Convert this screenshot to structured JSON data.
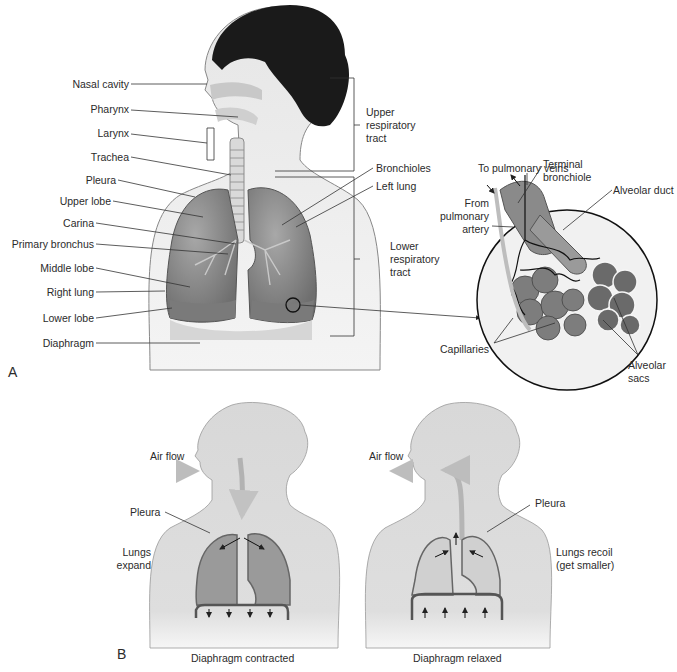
{
  "panel_a": {
    "panel_letter": "A",
    "left_labels": [
      "Nasal cavity",
      "Pharynx",
      "Larynx",
      "Trachea",
      "Pleura",
      "Upper lobe",
      "Carina",
      "Primary bronchus",
      "Middle lobe",
      "Right lung",
      "Lower lobe",
      "Diaphragm"
    ],
    "upper_tract": [
      "Upper",
      "respiratory",
      "tract"
    ],
    "lower_tract": [
      "Lower",
      "respiratory",
      "tract"
    ],
    "bronchioles": "Bronchioles",
    "left_lung": "Left lung",
    "inset": {
      "to_pulmonary_veins": "To pulmonary veins",
      "from_pulmonary_artery": [
        "From",
        "pulmonary",
        "artery"
      ],
      "terminal_bronchiole": [
        "Terminal",
        "bronchiole"
      ],
      "alveolar_duct": "Alveolar duct",
      "capillaries": "Capillaries",
      "alveolar_sacs": [
        "Alveolar",
        "sacs"
      ]
    }
  },
  "panel_b": {
    "panel_letter": "B",
    "inhale": {
      "air_flow": "Air flow",
      "pleura": "Pleura",
      "lungs_state": [
        "Lungs",
        "expand"
      ],
      "caption": "Diaphragm contracted"
    },
    "exhale": {
      "air_flow": "Air flow",
      "pleura": "Pleura",
      "lungs_state": [
        "Lungs recoil",
        "(get smaller)"
      ],
      "caption": "Diaphragm relaxed"
    }
  },
  "colors": {
    "skin": "#dcdcdc",
    "hair": "#1a1a1a",
    "lung": "#8f8f8f",
    "line": "#333333",
    "airflow": "#b5b5b5"
  }
}
